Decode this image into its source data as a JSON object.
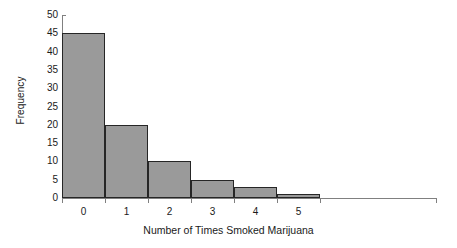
{
  "chart_data": {
    "type": "bar",
    "title": "",
    "xlabel": "Number of Times Smoked Marijuana",
    "ylabel": "Frequency",
    "categories": [
      "0",
      "1",
      "2",
      "3",
      "4",
      "5"
    ],
    "values": [
      45,
      20,
      10,
      5,
      3,
      1
    ],
    "ylim": [
      0,
      50
    ],
    "ytick_values": [
      0,
      5,
      10,
      15,
      20,
      25,
      30,
      35,
      40,
      45,
      50
    ],
    "ytick_labels": [
      "0",
      "5",
      "10",
      "15",
      "20",
      "25",
      "30",
      "35",
      "40",
      "45",
      "50"
    ],
    "grid": false,
    "legend": false,
    "bar_fill_color": "#9a9a9a",
    "bar_border_color": "#262626",
    "axis_color": "#808080",
    "text_color": "#1a1a1a",
    "background_color": "#ffffff"
  }
}
